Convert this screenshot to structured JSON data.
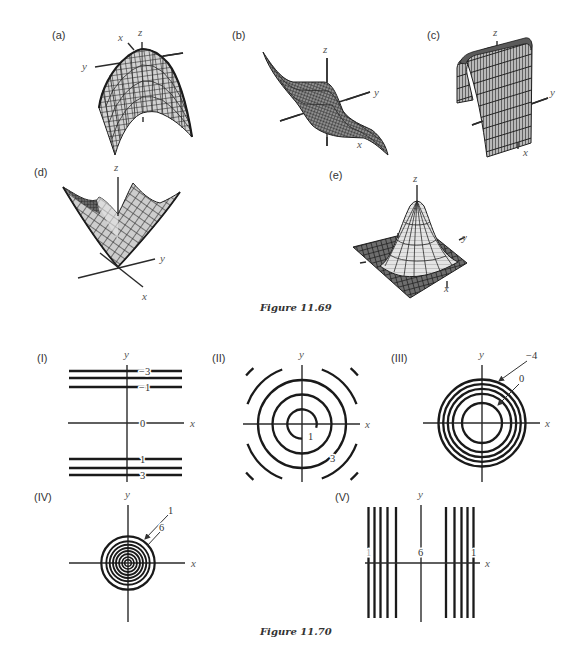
{
  "figure_11_69": {
    "caption": "Figure 11.69",
    "panels": {
      "a": {
        "label": "(a)",
        "x": "x",
        "y": "y",
        "z": "z"
      },
      "b": {
        "label": "(b)",
        "x": "x",
        "y": "y",
        "z": "z"
      },
      "c": {
        "label": "(c)",
        "x": "x",
        "y": "y",
        "z": "z"
      },
      "d": {
        "label": "(d)",
        "x": "x",
        "y": "y",
        "z": "z"
      },
      "e": {
        "label": "(e)",
        "x": "x",
        "y": "y",
        "z": "z"
      }
    }
  },
  "figure_11_70": {
    "caption": "Figure 11.70",
    "panels": {
      "I": {
        "label": "(I)",
        "x": "x",
        "y": "y",
        "contour_labels": [
          "−3",
          "−1",
          "0",
          "1",
          "3"
        ]
      },
      "II": {
        "label": "(II)",
        "x": "x",
        "y": "y",
        "contour_labels": [
          "1",
          "3"
        ]
      },
      "III": {
        "label": "(III)",
        "x": "x",
        "y": "y",
        "contour_labels": [
          "−4",
          "0"
        ]
      },
      "IV": {
        "label": "(IV)",
        "x": "x",
        "y": "y",
        "contour_labels": [
          "1",
          "6"
        ]
      },
      "V": {
        "label": "(V)",
        "x": "x",
        "y": "y",
        "contour_labels": [
          "1",
          "6",
          "1"
        ]
      }
    }
  },
  "colors": {
    "ink": "#1a1a1a",
    "background": "#ffffff",
    "mesh_fill": "#cfcfcf"
  }
}
